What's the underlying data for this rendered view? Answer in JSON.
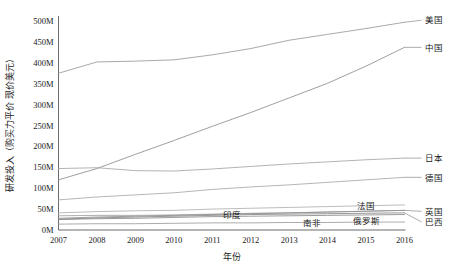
{
  "chart_data": {
    "type": "line",
    "title": "",
    "xlabel": "年份",
    "ylabel": "研发投入（购买力平价 现价美元）",
    "x": [
      2007,
      2008,
      2009,
      2010,
      2011,
      2012,
      2013,
      2014,
      2015,
      2016
    ],
    "xtick_labels": [
      "2007",
      "2008",
      "2009",
      "2010",
      "2011",
      "2012",
      "2013",
      "2014",
      "2015",
      "2016"
    ],
    "ytick_labels": [
      "0M",
      "50M",
      "100M",
      "150M",
      "200M",
      "250M",
      "300M",
      "350M",
      "400M",
      "450M",
      "500M"
    ],
    "ytick_values": [
      0,
      50,
      100,
      150,
      200,
      250,
      300,
      350,
      400,
      450,
      500
    ],
    "ylim": [
      0,
      520
    ],
    "xlim": [
      2007,
      2016
    ],
    "unit": "M",
    "grid": false,
    "legend_position": "inline-right",
    "series": [
      {
        "name": "美国",
        "label_side": "right",
        "color": "#9a9a9a",
        "values": [
          375,
          402,
          404,
          407,
          419,
          434,
          454,
          468,
          482,
          497
        ]
      },
      {
        "name": "中国",
        "label_side": "right",
        "color": "#8e8e8e",
        "values": [
          120,
          147,
          181,
          214,
          248,
          281,
          316,
          351,
          392,
          437
        ]
      },
      {
        "name": "日本",
        "label_side": "right",
        "color": "#a5a5a5",
        "values": [
          147,
          149,
          142,
          141,
          146,
          152,
          158,
          163,
          168,
          172
        ]
      },
      {
        "name": "德国",
        "label_side": "right",
        "color": "#a8a8a8",
        "values": [
          72,
          79,
          84,
          89,
          97,
          103,
          108,
          114,
          120,
          126
        ]
      },
      {
        "name": "法国",
        "label_side": "inline",
        "label_x": 2015.0,
        "label_y": 58,
        "color": "#b0b0b0",
        "values": [
          41,
          44,
          46,
          47,
          50,
          52,
          54,
          56,
          58,
          60
        ]
      },
      {
        "name": "英国",
        "label_side": "right",
        "color": "#9f9f9f",
        "values": [
          34,
          35,
          35,
          36,
          38,
          40,
          41,
          43,
          45,
          47
        ]
      },
      {
        "name": "巴西",
        "label_side": "right",
        "color": "#858585",
        "values": [
          26,
          29,
          31,
          33,
          35,
          37,
          38,
          39,
          40,
          41
        ]
      },
      {
        "name": "印度",
        "label_side": "inline",
        "label_x": 2011.5,
        "label_y": 36,
        "color": "#909090",
        "values": [
          28,
          31,
          33,
          35,
          37,
          39,
          41,
          43,
          45,
          47
        ]
      },
      {
        "name": "俄罗斯",
        "label_side": "inline",
        "label_x": 2015.0,
        "label_y": 22,
        "color": "#8a8a8a",
        "values": [
          25,
          27,
          28,
          30,
          32,
          33,
          34,
          35,
          36,
          37
        ]
      },
      {
        "name": "南非",
        "label_side": "inline",
        "label_x": 2013.6,
        "label_y": 18,
        "color": "#9c9c9c",
        "values": [
          14,
          15,
          15,
          16,
          17,
          17,
          18,
          18,
          19,
          19
        ]
      }
    ]
  }
}
